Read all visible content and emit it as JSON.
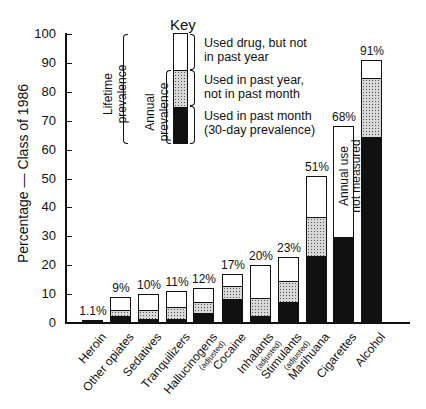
{
  "chart_data": {
    "type": "bar",
    "stacked": true,
    "title": "",
    "xlabel": "",
    "ylabel": "Percentage — Class of 1986",
    "ylim": [
      0,
      100
    ],
    "yticks": [
      0,
      10,
      20,
      30,
      40,
      50,
      60,
      70,
      80,
      90,
      100
    ],
    "grid": false,
    "legend_position": "top-center (Key)",
    "categories": [
      "Heroin",
      "Other opiates",
      "Sedatives",
      "Tranquilizers",
      "Hallucinogens (adjusted)",
      "Cocaine",
      "Inhalants (adjusted)",
      "Stimulants (adjusted)",
      "Marijuana",
      "Cigarettes",
      "Alcohol"
    ],
    "lifetime_labels": [
      "1.1%",
      "9%",
      "10%",
      "11%",
      "12%",
      "17%",
      "20%",
      "23%",
      "51%",
      "68%",
      "91%"
    ],
    "series": [
      {
        "name": "Used in past month (30-day prevalence)",
        "fill": "black",
        "values": [
          0.2,
          3,
          2,
          2,
          4,
          9,
          3,
          8,
          24,
          30,
          65
        ]
      },
      {
        "name": "Used in past year, not in past month",
        "fill": "stipple",
        "values": [
          0.3,
          2,
          3,
          4,
          3.5,
          4,
          6,
          7,
          13,
          null,
          20
        ]
      },
      {
        "name": "Used drug, but not in past year",
        "fill": "white",
        "values": [
          0.6,
          4,
          5,
          5,
          4.5,
          4,
          11,
          8,
          14,
          38,
          6
        ]
      }
    ],
    "lifetime_totals": [
      1.1,
      9,
      10,
      11,
      12,
      17,
      20,
      23,
      51,
      68,
      91
    ],
    "annotations": [
      {
        "category": "Cigarettes",
        "text": "Annual use not measured"
      }
    ],
    "key": {
      "title": "Key",
      "groups": [
        "Lifetime prevalence",
        "Annual prevalence"
      ],
      "entries": [
        "Used drug, but not in past year",
        "Used in past year, not in past month",
        "Used in past month (30-day prevalence)"
      ]
    }
  },
  "key": {
    "title": "Key",
    "lifetime": "Lifetime prevalence",
    "annual": "Annual prevalence",
    "e1a": "Used drug, but not",
    "e1b": "in past year",
    "e2a": "Used in past year,",
    "e2b": "not in past month",
    "e3a": "Used in past month",
    "e3b": "(30-day prevalence)"
  },
  "axis": {
    "ylabel": "Percentage — Class of 1986",
    "ticks": [
      "0",
      "10",
      "20",
      "30",
      "40",
      "50",
      "60",
      "70",
      "80",
      "90",
      "100"
    ]
  },
  "cig_note": {
    "l1": "Annual use",
    "l2": "not measured"
  },
  "xlabels": [
    {
      "main": "Heroin",
      "sub": ""
    },
    {
      "main": "Other opiates",
      "sub": ""
    },
    {
      "main": "Sedatives",
      "sub": ""
    },
    {
      "main": "Tranquilizers",
      "sub": ""
    },
    {
      "main": "Hallucinogens",
      "sub": "(adjusted)"
    },
    {
      "main": "Cocaine",
      "sub": ""
    },
    {
      "main": "Inhalants",
      "sub": "(adjusted)"
    },
    {
      "main": "Stimulants",
      "sub": "(adjusted)"
    },
    {
      "main": "Marihuana",
      "sub": ""
    },
    {
      "main": "Cigarettes",
      "sub": ""
    },
    {
      "main": "Alcohol",
      "sub": ""
    }
  ]
}
